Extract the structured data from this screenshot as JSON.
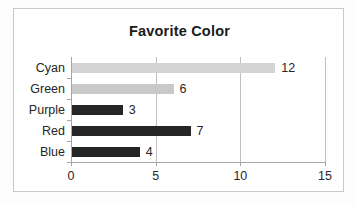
{
  "chart_data": {
    "type": "bar",
    "orientation": "horizontal",
    "title": "Favorite Color",
    "xlabel": "",
    "ylabel": "",
    "categories": [
      "Cyan",
      "Green",
      "Purple",
      "Red",
      "Blue"
    ],
    "values": [
      12,
      6,
      3,
      7,
      4
    ],
    "data_labels": [
      "12",
      "6",
      "3",
      "7",
      "4"
    ],
    "bar_colors": [
      "#d4d4d4",
      "#c9c9c9",
      "#262626",
      "#262626",
      "#262626"
    ],
    "xlim": [
      0,
      15
    ],
    "xticks": [
      0,
      5,
      10,
      15
    ],
    "xtick_labels": [
      "0",
      "5",
      "10",
      "15"
    ],
    "grid": "vertical",
    "legend": "none"
  },
  "style": {
    "frame_border": "#c9c9c9",
    "plot_background": "#ffffff",
    "page_background": "#fdfdfd",
    "axis_color": "#a6a6a6",
    "gridline_color": "#bfbfbf",
    "text_color": "#262626",
    "title_color": "#1a1a1a"
  }
}
